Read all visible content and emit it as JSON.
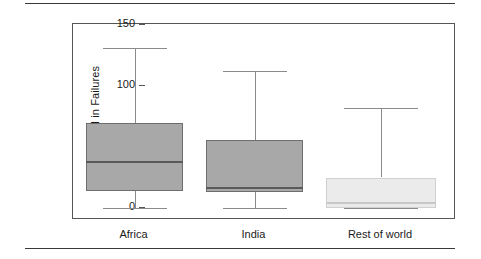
{
  "figure": {
    "has_top_rule": true,
    "has_bottom_rule": true
  },
  "chart_data": {
    "type": "box",
    "title": "",
    "xlabel": "",
    "ylabel": "Percent API in Failures",
    "ylim": [
      0,
      150
    ],
    "yticks": [
      0,
      50,
      100,
      150
    ],
    "ytick_labels": [
      "0",
      "50",
      "100",
      "150"
    ],
    "grid": false,
    "legend": false,
    "categories": [
      "Africa",
      "India",
      "Rest of world"
    ],
    "boxes": [
      {
        "label": "Africa",
        "whisker_low": 0,
        "q1": 14,
        "median": 38,
        "q3": 70,
        "whisker_high": 131,
        "fill": "#a8a8a8",
        "stroke": "#6e6e6e"
      },
      {
        "label": "India",
        "whisker_low": 0,
        "q1": 13,
        "median": 16,
        "q3": 56,
        "whisker_high": 112,
        "fill": "#a8a8a8",
        "stroke": "#6e6e6e"
      },
      {
        "label": "Rest of world",
        "whisker_low": 0,
        "q1": 0,
        "median": 4,
        "q3": 25,
        "whisker_high": 82,
        "fill": "#ebebeb",
        "stroke": "#d0d0d0"
      }
    ],
    "colors": {
      "axis": "#555555",
      "text": "#1a1a1a",
      "whisker": "#8a8a8a",
      "rule": "#3a3a3a"
    }
  }
}
